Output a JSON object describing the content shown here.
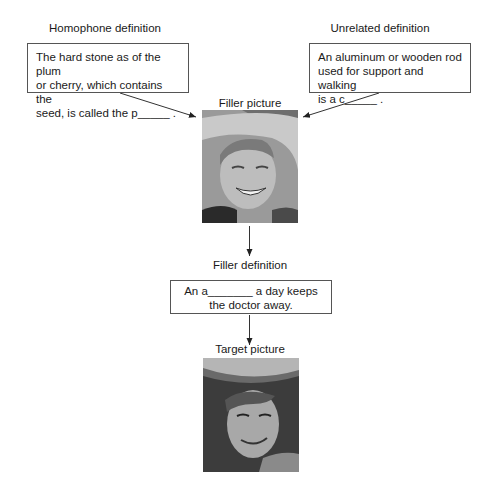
{
  "homophone": {
    "label": "Homophone definition",
    "lines": [
      "The hard stone as of the plum",
      "or cherry, which contains the",
      "seed, is called the p_____ ."
    ]
  },
  "unrelated": {
    "label": "Unrelated definition",
    "lines": [
      "An aluminum or wooden rod",
      "used for support and walking",
      "is a c_____ ."
    ]
  },
  "filler_picture": {
    "label": "Filler picture",
    "description": "grayscale photo of a smiling older man wearing a cowboy hat"
  },
  "filler_definition": {
    "label": "Filler definition",
    "lines": [
      "An a_______ a day keeps",
      "the doctor away."
    ]
  },
  "target_picture": {
    "label": "Target picture",
    "description": "grayscale photo of a smiling young man wearing a cowboy hat"
  }
}
